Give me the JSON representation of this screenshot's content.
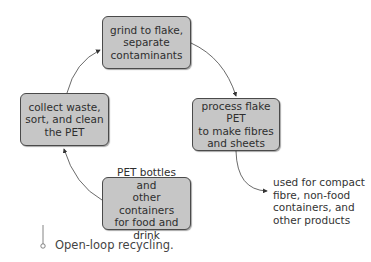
{
  "diagram": {
    "type": "cycle-flow",
    "nodes": [
      {
        "id": "grind",
        "label": "grind to flake,\nseparate\ncontaminants"
      },
      {
        "id": "process",
        "label": "process flake PET\nto make fibres\nand sheets"
      },
      {
        "id": "bottles",
        "label": "PET bottles and\nother containers\nfor food and drink"
      },
      {
        "id": "collect",
        "label": "collect waste,\nsort, and clean\nthe PET"
      }
    ],
    "edges": [
      {
        "from": "bottles",
        "to": "collect"
      },
      {
        "from": "collect",
        "to": "grind"
      },
      {
        "from": "grind",
        "to": "process"
      },
      {
        "from": "process",
        "to": "outcome"
      }
    ],
    "outcome": {
      "id": "outcome",
      "label": "used for compact\nfibre, non-food\ncontainers, and\nother products"
    },
    "caption": "Open-loop recycling.",
    "colors": {
      "box_fill": "#c6c6c6",
      "box_border": "#4a4a4a",
      "arrow": "#333333"
    }
  }
}
